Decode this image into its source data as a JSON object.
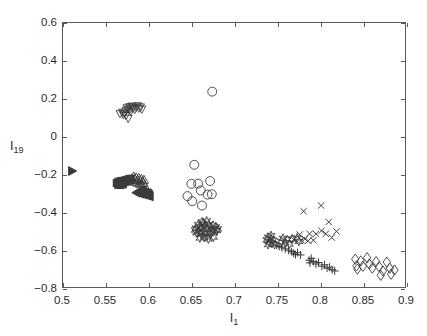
{
  "chart_data": {
    "type": "scatter",
    "title": "",
    "xlabel": "I_1",
    "xlabel_base": "I",
    "xlabel_sub": "1",
    "ylabel": "I_19",
    "ylabel_base": "I",
    "ylabel_sub": "19",
    "xlim": [
      0.5,
      0.9
    ],
    "ylim": [
      -0.8,
      0.6
    ],
    "xticks": [
      0.5,
      0.55,
      0.6,
      0.65,
      0.7,
      0.75,
      0.8,
      0.85,
      0.9
    ],
    "xtick_labels": [
      "0.5",
      "0.55",
      "0.6",
      "0.65",
      "0.7",
      "0.75",
      "0.8",
      "0.85",
      "0.9"
    ],
    "yticks": [
      -0.8,
      -0.6,
      -0.4,
      -0.2,
      0,
      0.2,
      0.4,
      0.6
    ],
    "ytick_labels": [
      "-0.8",
      "-0.6",
      "-0.4",
      "-0.2",
      "0",
      "0.2",
      "0.4",
      "0.6"
    ],
    "grid": false,
    "legend": "none",
    "marker_color": "#3a3a3a",
    "axis_color": "#5a5a5a",
    "background": "#ffffff",
    "series": [
      {
        "name": "right-triangle-group",
        "marker": "triangle-right",
        "filled": true,
        "size": 9,
        "points": [
          [
            0.5105,
            -0.185
          ]
        ]
      },
      {
        "name": "down-triangle-group",
        "marker": "triangle-down",
        "filled": false,
        "size": 8,
        "points": [
          [
            0.5665,
            0.118
          ],
          [
            0.5695,
            0.126
          ],
          [
            0.5705,
            0.112
          ],
          [
            0.5735,
            0.134
          ],
          [
            0.5745,
            0.149
          ],
          [
            0.576,
            0.141
          ],
          [
            0.5775,
            0.155
          ],
          [
            0.579,
            0.146
          ],
          [
            0.579,
            0.131
          ],
          [
            0.5805,
            0.158
          ],
          [
            0.582,
            0.149
          ],
          [
            0.5835,
            0.139
          ],
          [
            0.5855,
            0.152
          ],
          [
            0.587,
            0.16
          ],
          [
            0.5885,
            0.147
          ],
          [
            0.5905,
            0.154
          ],
          [
            0.592,
            0.142
          ],
          [
            0.576,
            0.093
          ],
          [
            0.5735,
            0.108
          ],
          [
            0.5715,
            0.121
          ]
        ]
      },
      {
        "name": "square-group",
        "marker": "square",
        "filled": true,
        "size": 7,
        "points": [
          [
            0.5625,
            -0.249
          ],
          [
            0.5645,
            -0.241
          ],
          [
            0.566,
            -0.252
          ],
          [
            0.5675,
            -0.238
          ],
          [
            0.569,
            -0.246
          ],
          [
            0.5705,
            -0.236
          ],
          [
            0.572,
            -0.244
          ],
          [
            0.5735,
            -0.232
          ],
          [
            0.575,
            -0.24
          ],
          [
            0.5765,
            -0.228
          ],
          [
            0.578,
            -0.236
          ],
          [
            0.5795,
            -0.225
          ],
          [
            0.564,
            -0.258
          ],
          [
            0.567,
            -0.26
          ],
          [
            0.57,
            -0.256
          ]
        ]
      },
      {
        "name": "up-triangle-group",
        "marker": "triangle-up",
        "filled": false,
        "size": 9,
        "points": [
          [
            0.5805,
            -0.224
          ],
          [
            0.5825,
            -0.213
          ],
          [
            0.584,
            -0.228
          ],
          [
            0.5855,
            -0.218
          ],
          [
            0.587,
            -0.232
          ],
          [
            0.5885,
            -0.221
          ],
          [
            0.59,
            -0.236
          ],
          [
            0.5915,
            -0.226
          ],
          [
            0.593,
            -0.24
          ],
          [
            0.5945,
            -0.231
          ],
          [
            0.586,
            -0.245
          ],
          [
            0.589,
            -0.25
          ],
          [
            0.583,
            -0.24
          ],
          [
            0.591,
            -0.255
          ],
          [
            0.594,
            -0.248
          ]
        ]
      },
      {
        "name": "left-triangle-group",
        "marker": "triangle-left",
        "filled": true,
        "size": 9,
        "points": [
          [
            0.5855,
            -0.3
          ],
          [
            0.5875,
            -0.295
          ],
          [
            0.5895,
            -0.305
          ],
          [
            0.5915,
            -0.298
          ],
          [
            0.5935,
            -0.31
          ],
          [
            0.5955,
            -0.303
          ],
          [
            0.5975,
            -0.315
          ],
          [
            0.5995,
            -0.308
          ],
          [
            0.601,
            -0.32
          ],
          [
            0.59,
            -0.29
          ],
          [
            0.593,
            -0.288
          ],
          [
            0.596,
            -0.296
          ],
          [
            0.5985,
            -0.302
          ],
          [
            0.6005,
            -0.312
          ]
        ]
      },
      {
        "name": "circle-group",
        "marker": "circle",
        "filled": false,
        "size": 9,
        "points": [
          [
            0.6745,
            0.236
          ],
          [
            0.6535,
            -0.152
          ],
          [
            0.65,
            -0.253
          ],
          [
            0.6455,
            -0.318
          ],
          [
            0.651,
            -0.345
          ],
          [
            0.661,
            -0.288
          ],
          [
            0.6625,
            -0.368
          ],
          [
            0.669,
            -0.31
          ],
          [
            0.672,
            -0.238
          ],
          [
            0.674,
            -0.308
          ],
          [
            0.658,
            -0.252
          ]
        ]
      },
      {
        "name": "star-group-mid",
        "marker": "star",
        "filled": false,
        "size": 8,
        "points": [
          [
            0.6555,
            -0.488
          ],
          [
            0.658,
            -0.47
          ],
          [
            0.659,
            -0.505
          ],
          [
            0.6605,
            -0.481
          ],
          [
            0.6615,
            -0.52
          ],
          [
            0.663,
            -0.492
          ],
          [
            0.664,
            -0.463
          ],
          [
            0.6655,
            -0.51
          ],
          [
            0.6665,
            -0.478
          ],
          [
            0.668,
            -0.53
          ],
          [
            0.669,
            -0.495
          ],
          [
            0.6705,
            -0.468
          ],
          [
            0.6715,
            -0.515
          ],
          [
            0.673,
            -0.487
          ],
          [
            0.6745,
            -0.505
          ],
          [
            0.6755,
            -0.473
          ],
          [
            0.677,
            -0.498
          ],
          [
            0.6785,
            -0.482
          ],
          [
            0.68,
            -0.5
          ],
          [
            0.66,
            -0.54
          ],
          [
            0.665,
            -0.535
          ],
          [
            0.67,
            -0.545
          ],
          [
            0.656,
            -0.512
          ],
          [
            0.6625,
            -0.455
          ],
          [
            0.668,
            -0.45
          ],
          [
            0.676,
            -0.535
          ],
          [
            0.681,
            -0.492
          ],
          [
            0.6545,
            -0.498
          ]
        ]
      },
      {
        "name": "star-group-right",
        "marker": "star",
        "filled": false,
        "size": 8,
        "points": [
          [
            0.7385,
            -0.55
          ],
          [
            0.74,
            -0.536
          ],
          [
            0.7415,
            -0.562
          ],
          [
            0.743,
            -0.545
          ],
          [
            0.7445,
            -0.568
          ],
          [
            0.746,
            -0.552
          ],
          [
            0.7475,
            -0.575
          ],
          [
            0.74,
            -0.575
          ],
          [
            0.7435,
            -0.528
          ],
          [
            0.7555,
            -0.558
          ],
          [
            0.7575,
            -0.542
          ],
          [
            0.76,
            -0.565
          ],
          [
            0.7625,
            -0.55
          ],
          [
            0.765,
            -0.572
          ],
          [
            0.768,
            -0.545
          ],
          [
            0.774,
            -0.54
          ],
          [
            0.776,
            -0.558
          ]
        ]
      },
      {
        "name": "plus-group",
        "marker": "plus",
        "filled": false,
        "size": 8,
        "points": [
          [
            0.75,
            -0.578
          ],
          [
            0.753,
            -0.585
          ],
          [
            0.756,
            -0.592
          ],
          [
            0.76,
            -0.598
          ],
          [
            0.764,
            -0.605
          ],
          [
            0.7675,
            -0.612
          ],
          [
            0.77,
            -0.62
          ],
          [
            0.772,
            -0.628
          ],
          [
            0.788,
            -0.658
          ],
          [
            0.789,
            -0.672
          ],
          [
            0.7905,
            -0.648
          ],
          [
            0.793,
            -0.665
          ],
          [
            0.796,
            -0.678
          ],
          [
            0.799,
            -0.67
          ],
          [
            0.803,
            -0.69
          ],
          [
            0.806,
            -0.682
          ],
          [
            0.809,
            -0.7
          ],
          [
            0.812,
            -0.695
          ],
          [
            0.815,
            -0.708
          ],
          [
            0.818,
            -0.715
          ],
          [
            0.7745,
            -0.618
          ],
          [
            0.778,
            -0.63
          ]
        ]
      },
      {
        "name": "x-group",
        "marker": "x",
        "filled": false,
        "size": 8,
        "points": [
          [
            0.777,
            -0.522
          ],
          [
            0.779,
            -0.552
          ],
          [
            0.7815,
            -0.398
          ],
          [
            0.783,
            -0.545
          ],
          [
            0.7885,
            -0.518
          ],
          [
            0.793,
            -0.552
          ],
          [
            0.796,
            -0.518
          ],
          [
            0.802,
            -0.368
          ],
          [
            0.8025,
            -0.502
          ],
          [
            0.8075,
            -0.518
          ],
          [
            0.811,
            -0.455
          ],
          [
            0.8145,
            -0.538
          ],
          [
            0.82,
            -0.505
          ],
          [
            0.77,
            -0.548
          ],
          [
            0.787,
            -0.555
          ]
        ]
      },
      {
        "name": "diamond-group",
        "marker": "diamond",
        "filled": false,
        "size": 9,
        "points": [
          [
            0.842,
            -0.652
          ],
          [
            0.8435,
            -0.688
          ],
          [
            0.8445,
            -0.705
          ],
          [
            0.8485,
            -0.662
          ],
          [
            0.851,
            -0.69
          ],
          [
            0.856,
            -0.645
          ],
          [
            0.8585,
            -0.678
          ],
          [
            0.862,
            -0.7
          ],
          [
            0.8665,
            -0.665
          ],
          [
            0.87,
            -0.692
          ],
          [
            0.8745,
            -0.715
          ],
          [
            0.879,
            -0.668
          ],
          [
            0.8825,
            -0.7
          ],
          [
            0.884,
            -0.732
          ],
          [
            0.888,
            -0.71
          ],
          [
            0.872,
            -0.738
          ]
        ]
      }
    ]
  }
}
